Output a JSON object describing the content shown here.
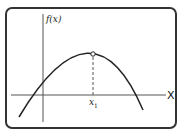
{
  "diagram": {
    "type": "function-graph",
    "y_axis_label": "f(x)",
    "x_axis_label": "X",
    "max_point_label_base": "x",
    "max_point_label_sub": "1",
    "colors": {
      "frame": "#333333",
      "axes": "#555555",
      "curve": "#222222",
      "dashed": "#555555",
      "background": "#ffffff"
    }
  }
}
